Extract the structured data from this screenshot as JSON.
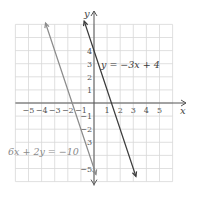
{
  "chart_data": {
    "type": "line",
    "title": "",
    "xlabel": "x",
    "ylabel": "y",
    "xlim": [
      -6,
      6
    ],
    "ylim": [
      -6,
      6
    ],
    "grid": true,
    "x_ticks": [
      "-5",
      "-4",
      "-3",
      "-2",
      "-1",
      "1",
      "2",
      "3",
      "4",
      "5"
    ],
    "y_ticks": [
      "4",
      "3",
      "2",
      "1",
      "-1",
      "-2",
      "3",
      "-5"
    ],
    "series": [
      {
        "name": "y = -3x + 4",
        "label": "y = −3x + 4",
        "equation": "y = -3x + 4",
        "color": "#3a3a3a",
        "points": [
          [
            -0.75,
            6.25
          ],
          [
            3.2,
            -5.6
          ]
        ]
      },
      {
        "name": "6x + 2y = -10",
        "label": "6x + 2y = −10",
        "equation": "y = -3x - 5",
        "color": "#8a8a8a",
        "points": [
          [
            -3.7,
            6.1
          ],
          [
            0.15,
            -5.45
          ]
        ]
      }
    ]
  },
  "labels": {
    "x_axis": "x",
    "y_axis": "y",
    "line1": "y = −3x + 4",
    "line2": "6x + 2y = −10"
  },
  "colors": {
    "grid": "#d8d8d8",
    "axis": "#555555",
    "line1": "#3a3a3a",
    "line2": "#8a8a8a"
  }
}
